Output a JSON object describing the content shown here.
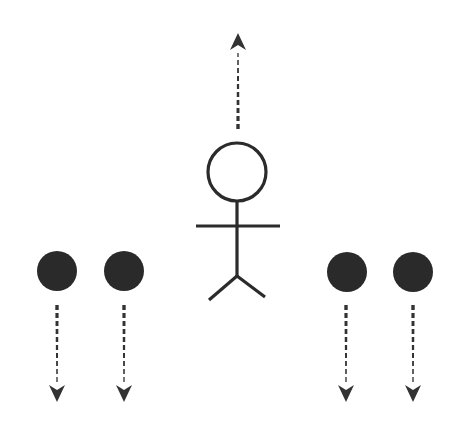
{
  "diagram": {
    "title": "Person moving up while four dots move down",
    "colors": {
      "background": "#ffffff",
      "stroke": "#2b2b2b",
      "dot_fill": "#2a2a2a",
      "arrow": "#333333"
    },
    "figure": {
      "name": "stick-figure",
      "head": {
        "cx": 237,
        "cy": 172,
        "r": 29
      },
      "body": {
        "x": 237,
        "y1": 201,
        "y2": 276
      },
      "arms": {
        "y": 226,
        "x1": 196,
        "x2": 280
      },
      "legs": {
        "hip_x": 237,
        "hip_y": 276,
        "left_end": [
          209,
          300
        ],
        "right_end": [
          265,
          297
        ]
      },
      "arrow": {
        "direction": "up",
        "x": 238,
        "y_start": 129,
        "y_tip": 33
      }
    },
    "dots": [
      {
        "id": "dot-1",
        "cx": 57,
        "cy": 271,
        "r": 20,
        "arrow": {
          "direction": "down",
          "x": 57,
          "y_start": 305,
          "y_tip": 402
        }
      },
      {
        "id": "dot-2",
        "cx": 124,
        "cy": 271,
        "r": 20,
        "arrow": {
          "direction": "down",
          "x": 124,
          "y_start": 305,
          "y_tip": 402
        }
      },
      {
        "id": "dot-3",
        "cx": 347,
        "cy": 272,
        "r": 20,
        "arrow": {
          "direction": "down",
          "x": 346,
          "y_start": 305,
          "y_tip": 402
        }
      },
      {
        "id": "dot-4",
        "cx": 413,
        "cy": 272,
        "r": 20,
        "arrow": {
          "direction": "down",
          "x": 413,
          "y_start": 305,
          "y_tip": 402
        }
      }
    ]
  }
}
